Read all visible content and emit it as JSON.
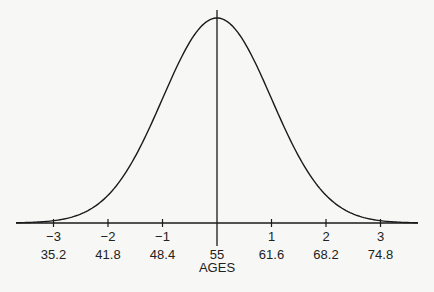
{
  "chart_data": {
    "type": "line",
    "title": "",
    "xlabel": "AGES",
    "ylabel": "",
    "distribution": "normal",
    "mean": 55,
    "std_dev": 6.6,
    "z_ticks": [
      "−3",
      "−2",
      "−1",
      "",
      "1",
      "2",
      "3"
    ],
    "age_ticks": [
      "35.2",
      "41.8",
      "48.4",
      "55",
      "61.6",
      "68.2",
      "74.8"
    ],
    "z_values": [
      -3,
      -2,
      -1,
      0,
      1,
      2,
      3
    ],
    "ages": [
      35.2,
      41.8,
      48.4,
      55,
      61.6,
      68.2,
      74.8
    ],
    "grid": false,
    "legend": null,
    "colors": {
      "curve": "#1a1a1a",
      "axis": "#1a1a1a",
      "background": "#f7f7f5"
    }
  }
}
